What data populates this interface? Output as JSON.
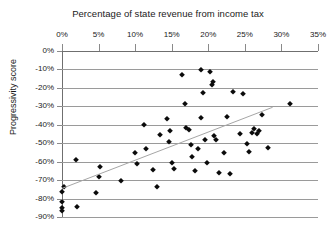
{
  "chart_data": {
    "type": "scatter",
    "title": "Percentage of state revenue from income tax",
    "xlabel": "Percentage of state revenue from income tax",
    "ylabel": "Progressivity score",
    "xlim": [
      0,
      35
    ],
    "ylim": [
      -90,
      0
    ],
    "grid": true,
    "legend": "none",
    "xticks": [
      "0%",
      "5%",
      "10%",
      "15%",
      "20%",
      "25%",
      "30%",
      "35%"
    ],
    "xtick_values": [
      0,
      5,
      10,
      15,
      20,
      25,
      30,
      35
    ],
    "yticks": [
      "0%",
      "-10%",
      "-20%",
      "-30%",
      "-40%",
      "-50%",
      "-60%",
      "-70%",
      "-80%",
      "-90%"
    ],
    "ytick_values": [
      0,
      -10,
      -20,
      -30,
      -40,
      -50,
      -60,
      -70,
      -80,
      -90
    ],
    "point_color": "#0b0b0b",
    "point_marker": "diamond",
    "trendline": {
      "present": true,
      "color": "#a6a6a6",
      "x_start": 0.0,
      "y_start": -74.5,
      "x_end": 28.8,
      "y_end": -30.5
    },
    "points": [
      {
        "x": 0.0,
        "y": -76.5
      },
      {
        "x": 0.0,
        "y": -82.0
      },
      {
        "x": 0.0,
        "y": -85.0
      },
      {
        "x": 0.0,
        "y": -86.5
      },
      {
        "x": 0.3,
        "y": -73.5
      },
      {
        "x": 2.0,
        "y": -84.5
      },
      {
        "x": 1.9,
        "y": -59.0
      },
      {
        "x": 5.0,
        "y": -68.5
      },
      {
        "x": 5.2,
        "y": -63.0
      },
      {
        "x": 4.6,
        "y": -77.0
      },
      {
        "x": 8.0,
        "y": -70.5
      },
      {
        "x": 10.0,
        "y": -55.5
      },
      {
        "x": 10.3,
        "y": -61.5
      },
      {
        "x": 11.2,
        "y": -40.0
      },
      {
        "x": 11.5,
        "y": -53.0
      },
      {
        "x": 12.5,
        "y": -64.5
      },
      {
        "x": 13.4,
        "y": -45.5
      },
      {
        "x": 13.0,
        "y": -74.0
      },
      {
        "x": 14.3,
        "y": -37.0
      },
      {
        "x": 14.8,
        "y": -43.5
      },
      {
        "x": 14.6,
        "y": -49.5
      },
      {
        "x": 15.0,
        "y": -60.5
      },
      {
        "x": 15.3,
        "y": -64.0
      },
      {
        "x": 16.4,
        "y": -13.0
      },
      {
        "x": 16.8,
        "y": -28.5
      },
      {
        "x": 17.0,
        "y": -42.0
      },
      {
        "x": 17.3,
        "y": -42.8
      },
      {
        "x": 17.6,
        "y": -51.0
      },
      {
        "x": 17.8,
        "y": -57.5
      },
      {
        "x": 18.2,
        "y": -65.0
      },
      {
        "x": 18.6,
        "y": -53.0
      },
      {
        "x": 19.0,
        "y": -10.5
      },
      {
        "x": 19.3,
        "y": -22.5
      },
      {
        "x": 19.0,
        "y": -36.5
      },
      {
        "x": 19.6,
        "y": -48.5
      },
      {
        "x": 19.8,
        "y": -60.5
      },
      {
        "x": 20.3,
        "y": -11.5
      },
      {
        "x": 20.6,
        "y": -17.0
      },
      {
        "x": 20.5,
        "y": -18.5
      },
      {
        "x": 20.8,
        "y": -46.0
      },
      {
        "x": 21.0,
        "y": -48.5
      },
      {
        "x": 21.4,
        "y": -66.0
      },
      {
        "x": 22.2,
        "y": -55.5
      },
      {
        "x": 22.6,
        "y": -36.0
      },
      {
        "x": 23.0,
        "y": -66.5
      },
      {
        "x": 23.4,
        "y": -22.0
      },
      {
        "x": 24.4,
        "y": -45.0
      },
      {
        "x": 24.8,
        "y": -23.5
      },
      {
        "x": 25.3,
        "y": -50.5
      },
      {
        "x": 25.6,
        "y": -54.5
      },
      {
        "x": 26.0,
        "y": -44.5
      },
      {
        "x": 26.6,
        "y": -44.8
      },
      {
        "x": 26.2,
        "y": -42.5
      },
      {
        "x": 27.0,
        "y": -43.5
      },
      {
        "x": 27.4,
        "y": -34.5
      },
      {
        "x": 28.2,
        "y": -52.5
      },
      {
        "x": 31.2,
        "y": -28.5
      }
    ]
  }
}
